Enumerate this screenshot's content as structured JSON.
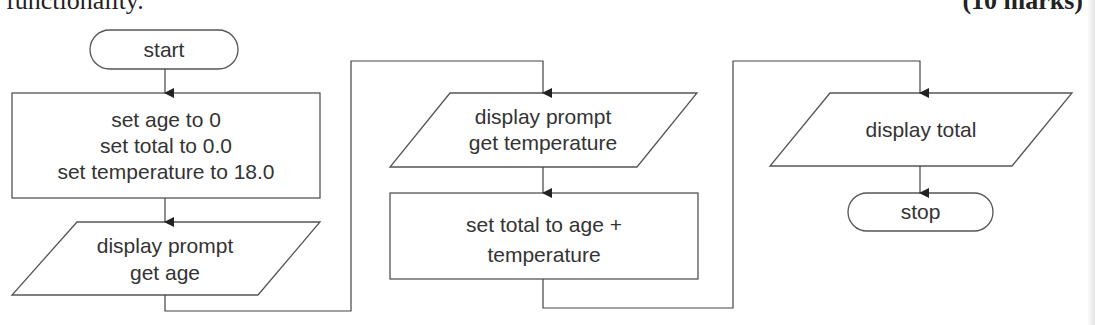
{
  "header": {
    "left_cut_text": "functionality.",
    "marks": "(10 marks)"
  },
  "flowchart": {
    "start": "start",
    "init_box": [
      "set age to 0",
      "set total to 0.0",
      "set temperature to 18.0"
    ],
    "input_age": [
      "display prompt",
      "get age"
    ],
    "input_temperature": [
      "display prompt",
      "get temperature"
    ],
    "calc_box": [
      "set total to age +",
      "temperature"
    ],
    "output_total": "display total",
    "stop": "stop"
  },
  "colors": {
    "stroke": "#555555",
    "text": "#333333"
  }
}
